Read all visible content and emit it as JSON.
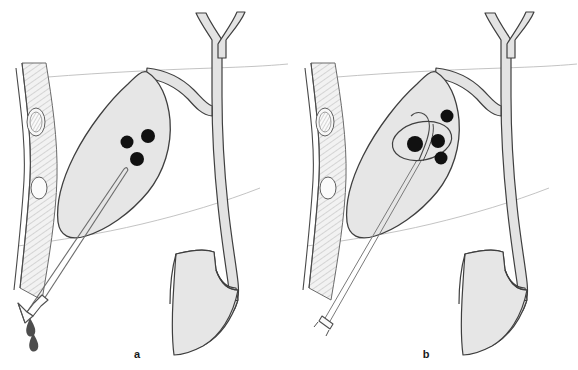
{
  "figure": {
    "type": "medical-line-illustration",
    "width": 578,
    "height": 370,
    "background_color": "#ffffff",
    "panel_count": 2
  },
  "colors": {
    "organ_fill": "#e6e6e6",
    "organ_fill_light": "#ededed",
    "duct_fill": "#e3e3e3",
    "outline": "#3a3a3a",
    "outline_soft": "#5c5c5c",
    "hatch_line": "#9a9a9a",
    "faint_line": "#b5b5b5",
    "stone_fill": "#111111",
    "droplet_fill": "#4d4d4d",
    "instrument_stroke": "#6b6b6b",
    "label_text": "#1a1a1a",
    "rib_fill": "#f4f4f4"
  },
  "panels": [
    {
      "id": "a",
      "label": "a",
      "label_x": 137,
      "label_y": 358,
      "caption_implied": "Percutaneous transhepatic catheter drainage of the gallbladder; bile drips from the external catheter hub",
      "origin_x": 0,
      "parts": {
        "abdominal_wall": {
          "name": "abdominal-wall",
          "hatched": true,
          "ribs": [
            {
              "name": "rib-upper",
              "cx": 36,
              "cy": 122,
              "rx": 9,
              "ry": 14,
              "textured": true
            },
            {
              "name": "rib-lower",
              "cx": 39,
              "cy": 188,
              "rx": 8,
              "ry": 11,
              "textured": false
            }
          ]
        },
        "gallbladder": {
          "name": "gallbladder",
          "stone_count": 3,
          "stones": [
            {
              "cx": 127,
              "cy": 142,
              "r": 6.5
            },
            {
              "cx": 148,
              "cy": 136,
              "r": 7.0
            },
            {
              "cx": 137,
              "cy": 159,
              "r": 7.0
            }
          ]
        },
        "instrument": {
          "name": "drainage-catheter",
          "type": "catheter",
          "has_hub": true,
          "hub_shape": "funnel",
          "droplets": [
            {
              "cx": 30,
              "cy": 325,
              "label": "bile-droplet-1"
            },
            {
              "cx": 33,
              "cy": 340,
              "label": "bile-droplet-2"
            }
          ]
        },
        "biliary_tree": {
          "name": "biliary-tree",
          "hepatic_ducts": "Y-shaped confluence",
          "common_bile_duct": true,
          "cystic_duct": true
        },
        "duodenum": {
          "name": "duodenum",
          "shape": "C-loop"
        },
        "liver_edge_lines": 2
      }
    },
    {
      "id": "b",
      "label": "b",
      "label_x": 426,
      "label_y": 358,
      "caption_implied": "Stone retrieval basket deployed through the transhepatic tract, capturing a gallstone",
      "origin_x": 289,
      "parts": {
        "abdominal_wall": {
          "name": "abdominal-wall",
          "hatched": true,
          "ribs": [
            {
              "name": "rib-upper",
              "cx": 36,
              "cy": 122,
              "rx": 9,
              "ry": 14,
              "textured": true
            },
            {
              "name": "rib-lower",
              "cx": 39,
              "cy": 188,
              "rx": 8,
              "ry": 11,
              "textured": false
            }
          ]
        },
        "gallbladder": {
          "name": "gallbladder",
          "stone_count": 4,
          "stones": [
            {
              "cx": 158,
              "cy": 116,
              "r": 6.5
            },
            {
              "cx": 126,
              "cy": 144,
              "r": 8.0
            },
            {
              "cx": 149,
              "cy": 141,
              "r": 7.0
            },
            {
              "cx": 152,
              "cy": 158,
              "r": 6.5
            }
          ]
        },
        "instrument": {
          "name": "stone-retrieval-basket",
          "type": "basket",
          "has_hub": true,
          "hub_shape": "small-hub",
          "basket_loop": {
            "cx": 133,
            "cy": 141,
            "rx": 30,
            "ry": 19,
            "rotation": -12
          },
          "captured_stone_index": 1,
          "droplets": []
        },
        "biliary_tree": {
          "name": "biliary-tree",
          "hepatic_ducts": "Y-shaped confluence",
          "common_bile_duct": true,
          "cystic_duct": true
        },
        "duodenum": {
          "name": "duodenum",
          "shape": "C-loop"
        },
        "liver_edge_lines": 2
      }
    }
  ]
}
